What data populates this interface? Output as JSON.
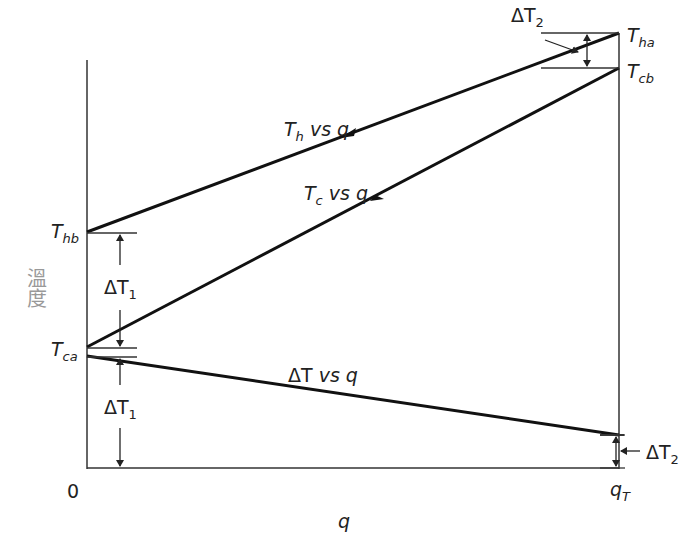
{
  "axes": {
    "y_label": "溫度",
    "x_label": "q",
    "x_origin": "0",
    "x_end": {
      "main": "q",
      "sub": "T"
    }
  },
  "points": {
    "T_ha": {
      "main": "T",
      "sub": "ha"
    },
    "T_cb": {
      "main": "T",
      "sub": "cb"
    },
    "T_hb": {
      "main": "T",
      "sub": "hb"
    },
    "T_ca": {
      "main": "T",
      "sub": "ca"
    }
  },
  "curves": {
    "hot": {
      "main": "T",
      "sub": "h",
      "rest": " vs q",
      "direction": "leftward"
    },
    "cold": {
      "main": "T",
      "sub": "c",
      "rest": " vs q",
      "direction": "rightward"
    },
    "delta": {
      "main": "ΔT",
      "rest": " vs q"
    }
  },
  "dimensions": {
    "dT1_upper": {
      "main": "ΔT",
      "sub": "1"
    },
    "dT1_lower": {
      "main": "ΔT",
      "sub": "1"
    },
    "dT2_upper": {
      "main": "ΔT",
      "sub": "2"
    },
    "dT2_lower": {
      "main": "ΔT",
      "sub": "2"
    }
  },
  "colors": {
    "line": "#111111",
    "axis": "#333333",
    "ylabel": "#999999"
  }
}
